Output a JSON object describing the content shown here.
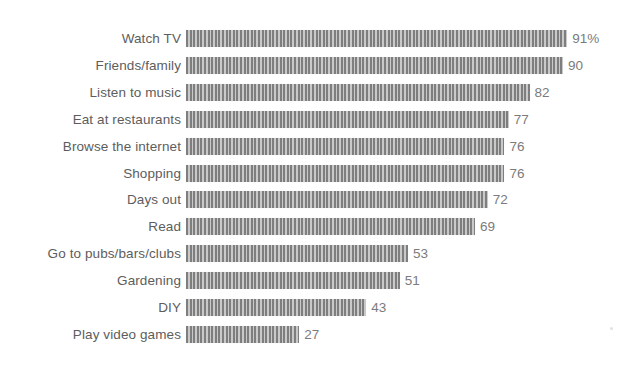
{
  "chart_data": {
    "type": "bar",
    "orientation": "horizontal",
    "title": "",
    "subtitle": "",
    "xlabel": "",
    "ylabel": "",
    "xlim": [
      0,
      100
    ],
    "grid": false,
    "legend": null,
    "value_suffix_first": "%",
    "categories": [
      "Watch TV",
      "Friends/family",
      "Listen to music",
      "Eat at restaurants",
      "Browse the internet",
      "Shopping",
      "Days out",
      "Read",
      "Go to pubs/bars/clubs",
      "Gardening",
      "DIY",
      "Play video games"
    ],
    "values": [
      91,
      90,
      82,
      77,
      76,
      76,
      72,
      69,
      53,
      51,
      43,
      27
    ],
    "value_labels": [
      "91%",
      "90",
      "82",
      "77",
      "76",
      "76",
      "72",
      "69",
      "53",
      "51",
      "43",
      "27"
    ],
    "bars": [
      {
        "label": "Watch TV",
        "value": 91,
        "value_label": "91%"
      },
      {
        "label": "Friends/family",
        "value": 90,
        "value_label": "90"
      },
      {
        "label": "Listen to music",
        "value": 82,
        "value_label": "82"
      },
      {
        "label": "Eat at restaurants",
        "value": 77,
        "value_label": "77"
      },
      {
        "label": "Browse the internet",
        "value": 76,
        "value_label": "76"
      },
      {
        "label": "Shopping",
        "value": 76,
        "value_label": "76"
      },
      {
        "label": "Days out",
        "value": 72,
        "value_label": "72"
      },
      {
        "label": "Read",
        "value": 69,
        "value_label": "69"
      },
      {
        "label": "Go to pubs/bars/clubs",
        "value": 53,
        "value_label": "53"
      },
      {
        "label": "Gardening",
        "value": 51,
        "value_label": "51"
      },
      {
        "label": "DIY",
        "value": 43,
        "value_label": "43"
      },
      {
        "label": "Play video games",
        "value": 27,
        "value_label": "27"
      }
    ],
    "colors": {
      "background": "#ffffff",
      "bar_stripe_dark": "#7e7e7e",
      "bar_stripe_light": "#c9c9c9",
      "label_text": "#5d5d5d",
      "value_text": "#7b7b7b"
    }
  }
}
